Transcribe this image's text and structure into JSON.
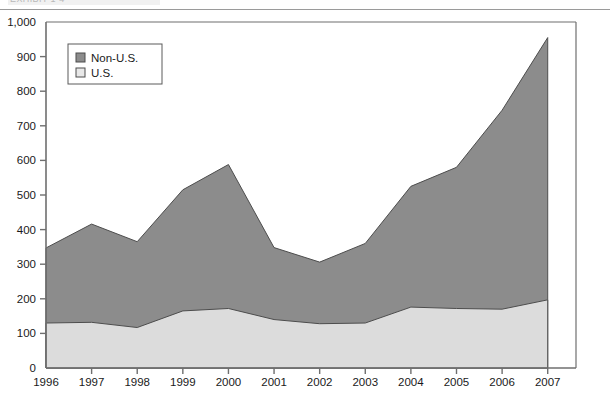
{
  "figure": {
    "clipped_caption": "EXHIBIT 1-4",
    "background_color": "#ffffff"
  },
  "chart_data": {
    "type": "area",
    "stacked": true,
    "title": "",
    "subtitle": "",
    "xlabel": "",
    "ylabel": "",
    "categories": [
      "1996",
      "1997",
      "1998",
      "1999",
      "2000",
      "2001",
      "2002",
      "2003",
      "2004",
      "2005",
      "2006",
      "2007"
    ],
    "series": [
      {
        "name": "U.S.",
        "color": "#dcdcdc",
        "values": [
          130,
          132,
          117,
          165,
          172,
          140,
          128,
          130,
          176,
          172,
          170,
          197
        ]
      },
      {
        "name": "Non-U.S.",
        "color": "#8c8c8c",
        "values": [
          217,
          284,
          248,
          350,
          416,
          208,
          178,
          230,
          349,
          408,
          575,
          758
        ]
      }
    ],
    "cumulative_totals": [
      347,
      416,
      365,
      515,
      588,
      348,
      306,
      360,
      525,
      580,
      745,
      955
    ],
    "ylim": [
      0,
      1000
    ],
    "ytick_values": [
      0,
      100,
      200,
      300,
      400,
      500,
      600,
      700,
      800,
      900,
      1000
    ],
    "ytick_labels": [
      "0",
      "100",
      "200",
      "300",
      "400",
      "500",
      "600",
      "700",
      "800",
      "900",
      "1,000"
    ],
    "grid": false,
    "legend_position": "top-left",
    "legend_entries": [
      {
        "label": "Non-U.S.",
        "swatch_color": "#8c8c8c"
      },
      {
        "label": "U.S.",
        "swatch_color": "#dcdcdc"
      }
    ]
  }
}
